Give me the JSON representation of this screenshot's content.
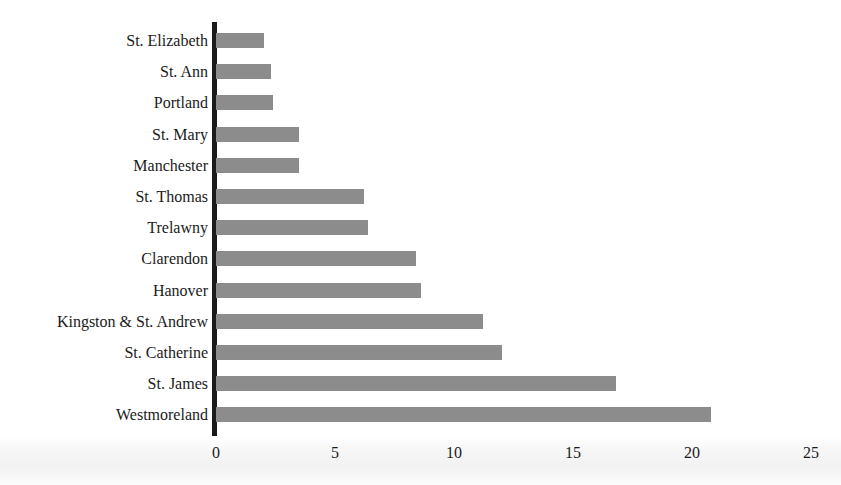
{
  "chart_data": {
    "type": "bar",
    "orientation": "horizontal",
    "title": "",
    "subtitle": "",
    "xlabel": "",
    "ylabel": "",
    "categories": [
      "St. Elizabeth",
      "St. Ann",
      "Portland",
      "St. Mary",
      "Manchester",
      "St. Thomas",
      "Trelawny",
      "Clarendon",
      "Hanover",
      "Kingston & St. Andrew",
      "St. Catherine",
      "St. James",
      "Westmoreland"
    ],
    "values": [
      2.0,
      2.3,
      2.4,
      3.5,
      3.5,
      6.2,
      6.4,
      8.4,
      8.6,
      11.2,
      12.0,
      16.8,
      20.8
    ],
    "xlim": [
      0,
      25
    ],
    "xticks": [
      0,
      5,
      10,
      15,
      20,
      25
    ],
    "xtick_labels": [
      "0",
      "5",
      "10",
      "15",
      "20",
      "25"
    ],
    "grid": false,
    "legend": null,
    "bar_color": "#8c8c8c",
    "axis_color": "#1a1a1a",
    "text_color": "#1b1b1b",
    "background_color": "#ffffff"
  }
}
